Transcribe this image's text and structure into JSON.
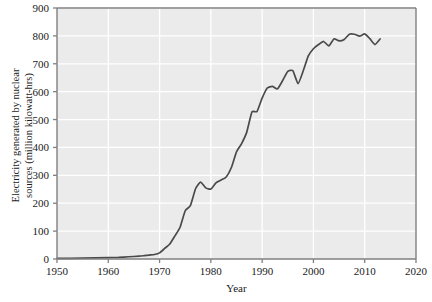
{
  "chart_data": {
    "type": "line",
    "title": "",
    "xlabel": "Year",
    "ylabel": "Electricity generated by nuclear sources (million kilowatt-hrs)",
    "ylabel_line1": "Electricity generated by nuclear",
    "ylabel_line2": "sources (million kilowatt-hrs)",
    "xlim": [
      1950,
      2020
    ],
    "ylim": [
      0,
      900
    ],
    "xticks": [
      1950,
      1960,
      1970,
      1980,
      1990,
      2000,
      2010,
      2020
    ],
    "yticks": [
      0,
      100,
      200,
      300,
      400,
      500,
      600,
      700,
      800,
      900
    ],
    "grid": true,
    "legend": "none",
    "line_color": "#4a4a4a",
    "plot_bg": "#ebebeb",
    "grid_color": "#ffffff",
    "axis_color": "#808080",
    "series": [
      {
        "name": "Electricity generated by nuclear sources",
        "x": [
          1950,
          1955,
          1960,
          1962,
          1964,
          1966,
          1967,
          1968,
          1969,
          1970,
          1971,
          1972,
          1973,
          1974,
          1975,
          1976,
          1977,
          1978,
          1979,
          1980,
          1981,
          1982,
          1983,
          1984,
          1985,
          1986,
          1987,
          1988,
          1989,
          1990,
          1991,
          1992,
          1993,
          1994,
          1995,
          1996,
          1997,
          1998,
          1999,
          2000,
          2001,
          2002,
          2003,
          2004,
          2005,
          2006,
          2007,
          2008,
          2009,
          2010,
          2011,
          2012,
          2013
        ],
        "y": [
          2,
          3,
          5,
          6,
          8,
          10,
          12,
          14,
          16,
          22,
          38,
          54,
          83,
          114,
          173,
          191,
          251,
          276,
          255,
          251,
          273,
          283,
          294,
          328,
          384,
          414,
          455,
          527,
          529,
          577,
          613,
          619,
          610,
          640,
          673,
          675,
          629,
          674,
          728,
          754,
          769,
          780,
          764,
          789,
          782,
          787,
          806,
          806,
          799,
          807,
          790,
          769,
          789
        ]
      }
    ]
  }
}
